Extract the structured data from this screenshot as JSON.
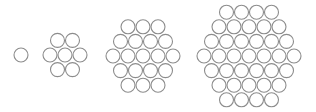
{
  "diagram": {
    "style": {
      "stroke": "#8c8c8c",
      "fill": "#ffffff",
      "background": "#ffffff"
    },
    "radius": 7,
    "dx": 15,
    "dy": 14.6,
    "clusters": [
      {
        "name": "cluster-1",
        "rings": 1,
        "count": 1,
        "cx": 21,
        "cy": 55
      },
      {
        "name": "cluster-7",
        "rings": 2,
        "count": 7,
        "cx": 65,
        "cy": 55
      },
      {
        "name": "cluster-19",
        "rings": 3,
        "count": 19,
        "cx": 143,
        "cy": 56
      },
      {
        "name": "cluster-37",
        "rings": 4,
        "count": 37,
        "cx": 249,
        "cy": 56
      }
    ]
  }
}
